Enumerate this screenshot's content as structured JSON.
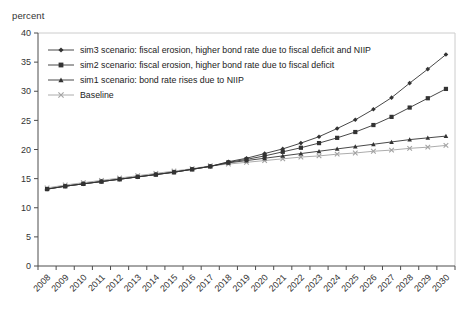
{
  "figure": {
    "axis_unit_label": "percent"
  },
  "chart_data": {
    "type": "line",
    "title": "",
    "ylabel": "percent",
    "xlabel": "",
    "ylim": [
      0,
      40
    ],
    "ytick_step": 5,
    "yticks": [
      0,
      5,
      10,
      15,
      20,
      25,
      30,
      35,
      40
    ],
    "grid": false,
    "legend_position": "top-left-inside",
    "x": [
      2008,
      2009,
      2010,
      2011,
      2012,
      2013,
      2014,
      2015,
      2016,
      2017,
      2018,
      2019,
      2020,
      2021,
      2022,
      2023,
      2024,
      2025,
      2026,
      2027,
      2028,
      2029,
      2030
    ],
    "series": [
      {
        "name": "sim3 scenario: fiscal erosion, higher bond rate due to fiscal deficit and NIIP",
        "marker": "diamond",
        "color": "#333333",
        "values": [
          13.2,
          13.7,
          14.1,
          14.5,
          14.9,
          15.3,
          15.7,
          16.1,
          16.6,
          17.1,
          17.9,
          18.5,
          19.3,
          20.1,
          21.1,
          22.2,
          23.6,
          25.1,
          26.9,
          28.9,
          31.4,
          33.8,
          36.3
        ]
      },
      {
        "name": "sim2 scenario: fiscal erosion, higher bond rate due to fiscal deficit",
        "marker": "square",
        "color": "#333333",
        "values": [
          13.2,
          13.7,
          14.1,
          14.5,
          14.9,
          15.3,
          15.7,
          16.1,
          16.6,
          17.1,
          17.8,
          18.3,
          18.9,
          19.6,
          20.3,
          21.1,
          22.0,
          23.0,
          24.2,
          25.6,
          27.2,
          28.8,
          30.4
        ]
      },
      {
        "name": "sim1 scenario: bond rate rises due to NIIP",
        "marker": "triangle",
        "color": "#333333",
        "values": [
          13.2,
          13.7,
          14.1,
          14.5,
          14.9,
          15.3,
          15.7,
          16.1,
          16.6,
          17.1,
          17.7,
          18.1,
          18.5,
          18.9,
          19.3,
          19.7,
          20.1,
          20.5,
          20.9,
          21.3,
          21.7,
          22.0,
          22.3
        ]
      },
      {
        "name": "Baseline",
        "marker": "x",
        "color": "#a3a3a3",
        "values": [
          13.4,
          13.9,
          14.3,
          14.7,
          15.1,
          15.5,
          15.9,
          16.3,
          16.7,
          17.2,
          17.5,
          17.8,
          18.1,
          18.4,
          18.7,
          18.9,
          19.2,
          19.4,
          19.7,
          19.9,
          20.2,
          20.4,
          20.7
        ]
      }
    ],
    "axis_colors": {
      "spine_dark": "#4d4d4d",
      "spine_light": "#cccccc",
      "tick_label": "#333333"
    }
  }
}
